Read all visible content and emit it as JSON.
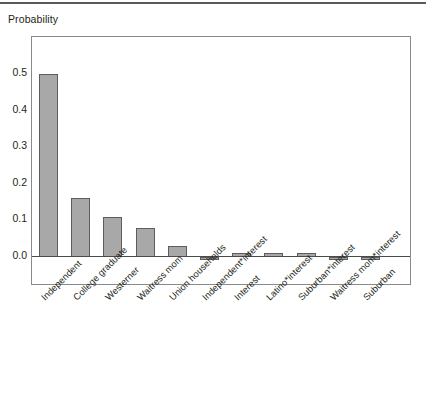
{
  "chart_data": {
    "type": "bar",
    "title": "",
    "subtitle": "",
    "ylabel": "Probability",
    "xlabel": "",
    "ylim": [
      -0.05,
      0.55
    ],
    "yticks": [
      "0.0",
      "0.1",
      "0.2",
      "0.3",
      "0.4",
      "0.5"
    ],
    "ytick_values": [
      0.0,
      0.1,
      0.2,
      0.3,
      0.4,
      0.5
    ],
    "grid": false,
    "legend": null,
    "bar_color": "#a8a8a8",
    "bar_edge_color": "#5d5d5f",
    "categories": [
      "Independent",
      "College graduate",
      "Westerner",
      "Waitress mom",
      "Union households",
      "Independent*interest",
      "Interest",
      "Latino*interest",
      "Suburban*interest",
      "Waitress mom*interest",
      "Suburban"
    ],
    "values": [
      0.5,
      0.16,
      0.11,
      0.08,
      0.03,
      -0.005,
      0.012,
      0.012,
      0.012,
      -0.005,
      -0.008
    ],
    "xtick_rotation": -45
  },
  "axis": {
    "ylabel": "Probability"
  }
}
